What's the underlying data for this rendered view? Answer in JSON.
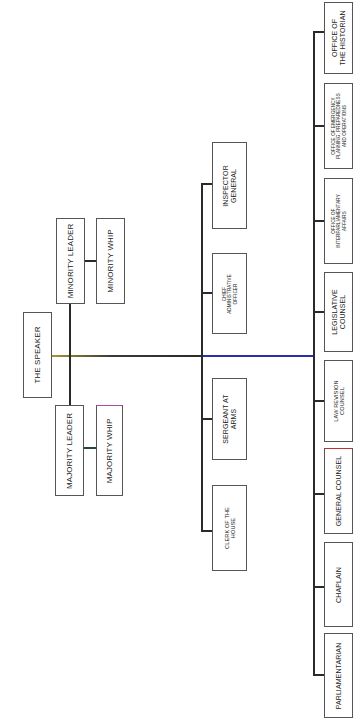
{
  "chart": {
    "orientation": "rotated 90 degrees counter-clockwise",
    "root": {
      "label": "THE SPEAKER"
    },
    "leadership": {
      "majority": [
        {
          "label": "MAJORITY LEADER"
        },
        {
          "label": "MAJORITY WHIP"
        }
      ],
      "minority": [
        {
          "label": "MINORITY LEADER"
        },
        {
          "label": "MINORITY WHIP"
        }
      ]
    },
    "officers": [
      {
        "label": "INSPECTOR\nGENERAL"
      },
      {
        "label": "CHIEF\nADMINISTRATIVE\nOFFICER"
      },
      {
        "label": "SERGEANT AT\nARMS"
      },
      {
        "label": "CLERK OF THE\nHOUSE"
      }
    ],
    "offices": [
      {
        "label": "OFFICE OF\nTHE HISTORIAN"
      },
      {
        "label": "OFFICE OF EMERGENCY\nPLANNING, PREPAREDNESS\nAND OPERATIONS"
      },
      {
        "label": "OFFICE OF\nINTERPARLIAMENTARY\nAFFAIRS"
      },
      {
        "label": "LEGISLATIVE\nCOUNSEL"
      },
      {
        "label": "LAW REVISION\nCOUNSEL"
      },
      {
        "label": "GENERAL COUNSEL"
      },
      {
        "label": "CHAPLAIN"
      },
      {
        "label": "PARLIAMENTARIAN"
      }
    ],
    "colors": {
      "line": "#2a2a2a",
      "speaker_line_left": "#a89a2a",
      "speaker_line_right": "#2b2fa8",
      "box_border": "#555555"
    }
  }
}
